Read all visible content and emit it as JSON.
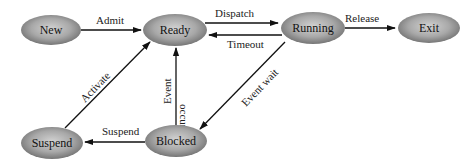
{
  "diagram": {
    "type": "state-transition",
    "nodes": {
      "new": {
        "label": "New"
      },
      "ready": {
        "label": "Ready"
      },
      "running": {
        "label": "Running"
      },
      "exit": {
        "label": "Exit"
      },
      "suspend": {
        "label": "Suspend"
      },
      "blocked": {
        "label": "Blocked"
      }
    },
    "edges": {
      "admit": {
        "from": "New",
        "to": "Ready",
        "label": "Admit"
      },
      "dispatch": {
        "from": "Ready",
        "to": "Running",
        "label": "Dispatch"
      },
      "timeout": {
        "from": "Running",
        "to": "Ready",
        "label": "Timeout"
      },
      "release": {
        "from": "Running",
        "to": "Exit",
        "label": "Release"
      },
      "event_wait": {
        "from": "Running",
        "to": "Blocked",
        "label": "Event wait"
      },
      "event_occurs": {
        "from": "Blocked",
        "to": "Ready",
        "label_line1": "Event",
        "label_line2": "occurs"
      },
      "suspend": {
        "from": "Blocked",
        "to": "Suspend",
        "label": "Suspend"
      },
      "activate": {
        "from": "Suspend",
        "to": "Ready",
        "label": "Activate"
      }
    },
    "colors": {
      "node_fill_light": "#d0d0d0",
      "node_fill_dark": "#6e6e6e",
      "edge": "#111111",
      "background": "#ffffff"
    }
  }
}
